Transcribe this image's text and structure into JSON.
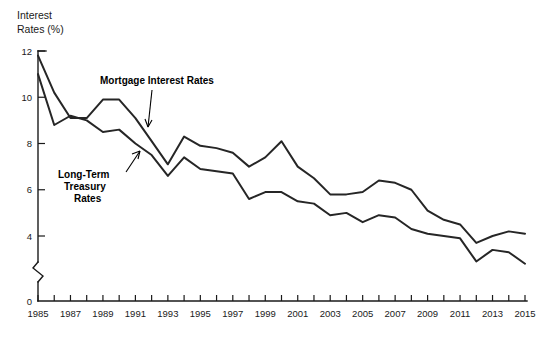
{
  "chart_data": {
    "type": "line",
    "title": "",
    "ylabel": "Interest Rates (%)",
    "xlabel": "",
    "grid": false,
    "legend_position": "inline-annotations",
    "y_axis_break": true,
    "ylim": [
      0,
      12
    ],
    "y_ticks": [
      0,
      4,
      6,
      8,
      10,
      12
    ],
    "y_tick_labels": [
      "0",
      "4",
      "6",
      "8",
      "10",
      "12"
    ],
    "xlim": [
      1985,
      2015
    ],
    "x_ticks": [
      1985,
      1986,
      1987,
      1988,
      1989,
      1990,
      1991,
      1992,
      1993,
      1994,
      1995,
      1996,
      1997,
      1998,
      1999,
      2000,
      2001,
      2002,
      2003,
      2004,
      2005,
      2006,
      2007,
      2008,
      2009,
      2010,
      2011,
      2012,
      2013,
      2014,
      2015
    ],
    "x_tick_labels": [
      "1985",
      "1987",
      "1989",
      "1991",
      "1993",
      "1995",
      "1997",
      "1999",
      "2001",
      "2003",
      "2005",
      "2007",
      "2009",
      "2011",
      "2013",
      "2015"
    ],
    "x_tick_label_years": [
      1985,
      1987,
      1989,
      1991,
      1993,
      1995,
      1997,
      1999,
      2001,
      2003,
      2005,
      2007,
      2009,
      2011,
      2013,
      2015
    ],
    "x": [
      1985,
      1986,
      1987,
      1988,
      1989,
      1990,
      1991,
      1992,
      1993,
      1994,
      1995,
      1996,
      1997,
      1998,
      1999,
      2000,
      2001,
      2002,
      2003,
      2004,
      2005,
      2006,
      2007,
      2008,
      2009,
      2010,
      2011,
      2012,
      2013,
      2014,
      2015
    ],
    "series": [
      {
        "name": "Mortgage Interest Rates",
        "label": "Mortgage Interest Rates",
        "color": "#262626",
        "values": [
          11.8,
          10.2,
          9.1,
          9.1,
          9.9,
          9.9,
          9.1,
          8.1,
          7.1,
          8.3,
          7.9,
          7.8,
          7.6,
          7.0,
          7.4,
          8.1,
          7.0,
          6.5,
          5.8,
          5.8,
          5.9,
          6.4,
          6.3,
          6.0,
          5.1,
          4.7,
          4.5,
          3.7,
          4.0,
          4.2,
          4.1
        ],
        "annotation_text": "Mortgage Interest Rates"
      },
      {
        "name": "Long-Term Treasury Rates",
        "label": "Long-Term Treasury Rates",
        "color": "#262626",
        "values": [
          11.0,
          8.8,
          9.2,
          9.0,
          8.5,
          8.6,
          8.0,
          7.5,
          6.6,
          7.4,
          6.9,
          6.8,
          6.7,
          5.6,
          5.9,
          5.9,
          5.5,
          5.4,
          4.9,
          5.0,
          4.6,
          4.9,
          4.8,
          4.3,
          4.1,
          4.0,
          3.9,
          2.9,
          3.4,
          3.3,
          2.8
        ]
      }
    ],
    "annotations": [
      {
        "text": "Mortgage Interest Rates",
        "target_year": 1991,
        "target_value": 9.5
      },
      {
        "text": "Long-Term Treasury Rates",
        "target_year": 1991,
        "target_value": 7.6
      }
    ]
  },
  "labels": {
    "y_axis_title_line1": "Interest",
    "y_axis_title_line2": "Rates (%)",
    "mortgage_label": "Mortgage Interest Rates",
    "treasury_label_line1": "Long-Term",
    "treasury_label_line2": "Treasury",
    "treasury_label_line3": "Rates"
  }
}
